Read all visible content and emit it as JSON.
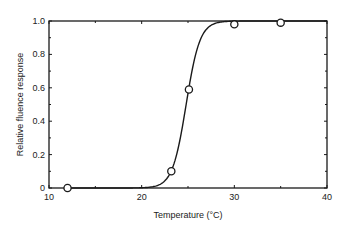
{
  "chart_data": {
    "type": "scatter",
    "title": "",
    "xlabel": "Temperature (°C)",
    "ylabel": "Relative fluence response",
    "xlim": [
      10,
      40
    ],
    "ylim": [
      0,
      1.0
    ],
    "x_ticks": [
      10,
      20,
      30,
      40
    ],
    "x_tick_labels": [
      "10",
      "20",
      "30",
      "40"
    ],
    "x_minor_step": 5,
    "y_ticks": [
      0,
      0.2,
      0.4,
      0.6,
      0.8,
      1.0
    ],
    "y_tick_labels": [
      "0",
      "0.2",
      "0.4",
      "0.6",
      "0.8",
      "1.0"
    ],
    "y_minor_step": 0.1,
    "grid": false,
    "legend": "none",
    "series": [
      {
        "name": "measured",
        "kind": "points",
        "marker": "open-circle",
        "x": [
          12,
          23.2,
          25.1,
          30,
          35
        ],
        "y": [
          0.0,
          0.1,
          0.59,
          0.98,
          0.99
        ]
      },
      {
        "name": "fit",
        "kind": "sigmoid-curve",
        "model": "logistic",
        "midpoint": 24.8,
        "slope": 1.35,
        "x_range": [
          12,
          40
        ]
      }
    ]
  }
}
